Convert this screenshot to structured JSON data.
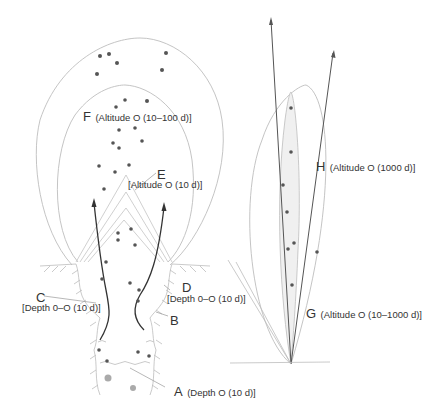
{
  "diagram": {
    "colors": {
      "line": "#b8b8b8",
      "dark_line": "#333333",
      "dot": "#555555",
      "gray_dot": "#aaaaaa",
      "fill": "#f0f0f0"
    },
    "labels": {
      "A": {
        "letter": "A",
        "text": "(Depth O (10 d)]"
      },
      "B": {
        "letter": "B",
        "text": ""
      },
      "C": {
        "letter": "C",
        "text": "[Depth 0–O (10 d)]"
      },
      "D": {
        "letter": "D",
        "text": "[Depth 0–O (10 d)]"
      },
      "E": {
        "letter": "E",
        "text": "[Altitude O (10 d)]"
      },
      "F": {
        "letter": "F",
        "text": "(Altitude O (10–100 d)]"
      },
      "G": {
        "letter": "G",
        "text": "(Altitude O (10–1000 d)]"
      },
      "H": {
        "letter": "H",
        "text": "(Altitude O (1000 d)]"
      }
    }
  }
}
